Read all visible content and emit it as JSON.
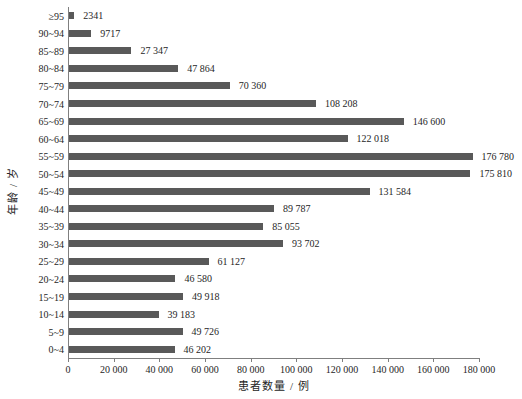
{
  "chart_data": {
    "type": "bar",
    "orientation": "horizontal",
    "title": "",
    "xlabel": "患者数量 / 例",
    "ylabel": "年龄 / 岁",
    "xlim": [
      0,
      180000
    ],
    "xticks": [
      0,
      20000,
      40000,
      60000,
      80000,
      100000,
      120000,
      140000,
      160000,
      180000
    ],
    "xtick_labels": [
      "0",
      "20 000",
      "40 000",
      "60 000",
      "80 000",
      "100 000",
      "120 000",
      "140 000",
      "160 000",
      "180 000"
    ],
    "categories": [
      "≥95",
      "90~94",
      "85~89",
      "80~84",
      "75~79",
      "70~74",
      "65~69",
      "60~64",
      "55~59",
      "50~54",
      "45~49",
      "40~44",
      "35~39",
      "30~34",
      "25~29",
      "20~24",
      "15~19",
      "10~14",
      "5~9",
      "0~4"
    ],
    "values": [
      2341,
      9717,
      27347,
      47864,
      70360,
      108208,
      146600,
      122018,
      176780,
      175810,
      131584,
      89787,
      85055,
      93702,
      61127,
      46580,
      49918,
      39183,
      49726,
      46202
    ],
    "value_labels": [
      "2341",
      "9717",
      "27 347",
      "47 864",
      "70 360",
      "108 208",
      "146 600",
      "122 018",
      "176 780",
      "175 810",
      "131 584",
      "89 787",
      "85 055",
      "93 702",
      "61 127",
      "46 580",
      "49 918",
      "39 183",
      "49 726",
      "46 202"
    ],
    "bar_color": "#595959",
    "axis_color": "#7f7f7f",
    "text_color": "#262626",
    "grid": false,
    "legend": null
  }
}
